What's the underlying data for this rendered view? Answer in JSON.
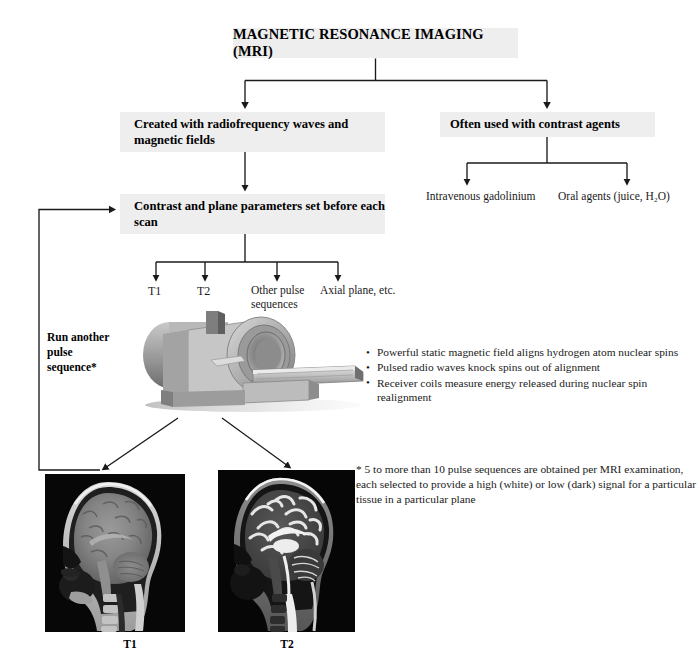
{
  "diagram": {
    "title": "MAGNETIC RESONANCE IMAGING (MRI)",
    "nodes": {
      "created": "Created with radiofrequency waves and magnetic fields",
      "contrast_agents": "Often used with contrast agents",
      "contrast_params": "Contrast and plane parameters set before each scan"
    },
    "agent_options": {
      "intravenous": "Intravenous gadolinium",
      "oral": "Oral agents (juice, H₂O)"
    },
    "parameter_branches": {
      "t1": "T1",
      "t2": "T2",
      "other_pulse": "Other pulse sequences",
      "axial": "Axial plane, etc."
    },
    "loop_label": "Run another pulse sequence*",
    "physics_bullets": [
      "Powerful static magnetic field aligns hydrogen atom nuclear spins",
      "Pulsed radio waves knock spins out of alignment",
      "Receiver coils measure energy released during nuclear spin realignment"
    ],
    "footnote": "* 5 to more than 10 pulse sequences are obtained per MRI examination, each selected to provide a high (white) or low (dark) signal for a particular tissue in a particular plane",
    "scan_captions": {
      "t1": "T1",
      "t2": "T2"
    },
    "icons": {
      "scanner": "mri-scanner-icon",
      "scan_t1": "brain-mri-t1-sagittal-image",
      "scan_t2": "brain-mri-t2-sagittal-image"
    },
    "colors": {
      "box_fill": "#eeeeee",
      "text": "#000000",
      "connector": "#1a1a1a",
      "page_background": "#ffffff"
    }
  }
}
